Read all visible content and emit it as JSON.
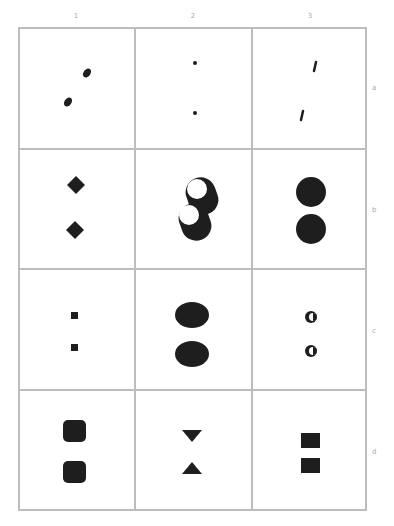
{
  "columns": [
    {
      "label": "1"
    },
    {
      "label": "2"
    },
    {
      "label": "3"
    }
  ],
  "rows": [
    {
      "label": "a"
    },
    {
      "label": "b"
    },
    {
      "label": "c"
    },
    {
      "label": "d"
    }
  ],
  "cells": [
    {
      "row": "a",
      "col": "1",
      "shape": "small-ellipse-pair-diagonal"
    },
    {
      "row": "a",
      "col": "2",
      "shape": "tiny-dot-pair"
    },
    {
      "row": "a",
      "col": "3",
      "shape": "slash-stroke-pair"
    },
    {
      "row": "b",
      "col": "1",
      "shape": "diamond-pair"
    },
    {
      "row": "b",
      "col": "2",
      "shape": "ring-with-hole-pair-overlapping"
    },
    {
      "row": "b",
      "col": "3",
      "shape": "large-circle-pair"
    },
    {
      "row": "c",
      "col": "1",
      "shape": "small-square-pair"
    },
    {
      "row": "c",
      "col": "2",
      "shape": "large-ellipse-pair"
    },
    {
      "row": "c",
      "col": "3",
      "shape": "crescent-moon-pair"
    },
    {
      "row": "d",
      "col": "1",
      "shape": "rounded-square-pair"
    },
    {
      "row": "d",
      "col": "2",
      "shape": "triangle-down-up-pair"
    },
    {
      "row": "d",
      "col": "3",
      "shape": "square-pair"
    }
  ],
  "colors": {
    "grid_line": "#bdbdbd",
    "shape_fill": "#1e1e1e",
    "label_text": "#aaaaaa"
  }
}
